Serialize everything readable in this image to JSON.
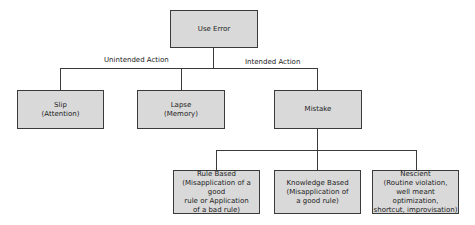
{
  "diagram": {
    "root": {
      "label": "Use Error"
    },
    "edges": {
      "unintended": "Unintended Action",
      "intended": "Intended Action"
    },
    "level1": [
      {
        "title": "Slip",
        "subtitle": "(Attention)"
      },
      {
        "title": "Lapse",
        "subtitle": "(Memory)"
      },
      {
        "title": "Mistake",
        "subtitle": ""
      }
    ],
    "level2": [
      {
        "title": "Rule Based",
        "lines": [
          "(Misapplication of a good",
          "rule or Application",
          "of a bad rule)"
        ]
      },
      {
        "title": "Knowledge Based",
        "lines": [
          "(Misapplication of",
          "a good rule)"
        ]
      },
      {
        "title": "Nescient",
        "lines": [
          "(Routine violation,",
          "well meant optimization,",
          "shortcut, improvisation)"
        ]
      }
    ]
  }
}
